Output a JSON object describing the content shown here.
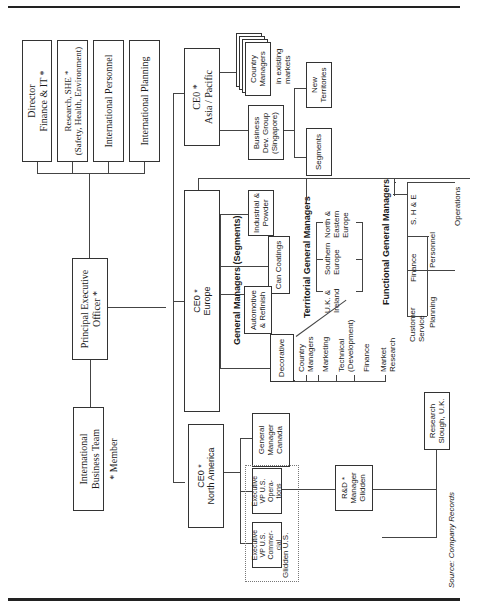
{
  "header": {
    "rule_color": "#222222"
  },
  "chart": {
    "staff": [
      {
        "line1": "Director",
        "line2": "Finance & IT *"
      },
      {
        "line1": "Research, SHE *",
        "line2": "(Safety, Health, Environment)"
      },
      {
        "line1": "International Personnel",
        "line2": ""
      },
      {
        "line1": "International Planning",
        "line2": ""
      }
    ],
    "pe_officer": {
      "line1": "Principal Executive",
      "line2": "Officer *"
    },
    "ibt": {
      "line1": "International",
      "line2": "Business Team",
      "member": "* Member"
    },
    "ceo_asia": {
      "line1": "CE0 *",
      "line2": "Asia / Pacific"
    },
    "country_managers": {
      "line1": "Country",
      "line2": "Managers",
      "note1": "in existing",
      "note2": "markets"
    },
    "bdg": {
      "line1": "Business",
      "line2": "Dev. Group",
      "line3": "(Singapore)"
    },
    "new_territories": {
      "line1": "New",
      "line2": "Territories"
    },
    "segments": {
      "label": "Segments"
    },
    "ceo_europe": {
      "line1": "CE0 *",
      "line2": "Europe"
    },
    "gm_segments_title": "General Managers (Segments)",
    "seg_boxes": [
      {
        "line1": "Industrial &",
        "line2": "Powder"
      },
      {
        "line1": "Can Coatings",
        "line2": ""
      },
      {
        "line1": "Automotive",
        "line2": "& Refinish"
      },
      {
        "line1": "Decorative",
        "line2": ""
      }
    ],
    "territorial_title": "Territorial General Managers",
    "territories": [
      {
        "line1": "North &",
        "line2": "Eastern",
        "line3": "Europe"
      },
      {
        "line1": "Southern",
        "line2": "Europe",
        "line3": ""
      },
      {
        "line1": "U.K. &",
        "line2": "Ireland",
        "line3": ""
      }
    ],
    "decor_functions": [
      {
        "line1": "Country",
        "line2": "Managers"
      },
      {
        "line1": "Marketing",
        "line2": ""
      },
      {
        "line1": "Technical",
        "line2": "(Development)"
      },
      {
        "line1": "Finance",
        "line2": ""
      },
      {
        "line1": "Market",
        "line2": "Research"
      }
    ],
    "functional_title": "Functional General Managers",
    "functional": [
      {
        "line1": "S. H & E",
        "line2": ""
      },
      {
        "line1": "Operations",
        "line2": ""
      },
      {
        "line1": "Personnel",
        "line2": ""
      },
      {
        "line1": "Finance",
        "line2": ""
      },
      {
        "line1": "Planning",
        "line2": ""
      },
      {
        "line1": "Customer",
        "line2": "Service"
      }
    ],
    "research_slough": {
      "line1": "Research",
      "line2": "Slough, U.K."
    },
    "ceo_na": {
      "line1": "CE0 *",
      "line2": "North America"
    },
    "gm_canada": {
      "line1": "General",
      "line2": "Manager",
      "line3": "Canada"
    },
    "evp_ops": {
      "line1": "Executive",
      "line2": "VP U.S.",
      "line3": "Opera-",
      "line4": "tions"
    },
    "evp_com": {
      "line1": "Executive",
      "line2": "VP U.S.",
      "line3": "Commer-",
      "line4": "cial"
    },
    "glidden_us": "Glidden U.S.",
    "rd_manager": {
      "line1": "R&D *",
      "line2": "Manager",
      "line3": "Glidden"
    }
  },
  "footer": {
    "source": "Source: Company Records"
  }
}
